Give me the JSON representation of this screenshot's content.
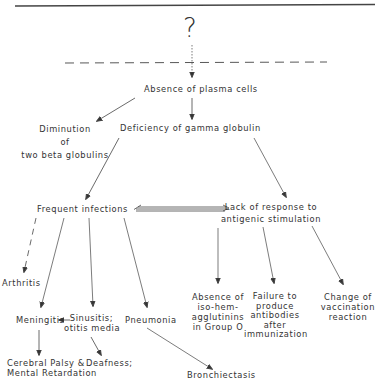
{
  "diagram": {
    "root": "?",
    "nodes": {
      "absence_plasma": "Absence of plasma cells",
      "diminution": [
        "Diminution",
        "of",
        "two beta globulins"
      ],
      "deficiency_gamma": "Deficiency of gamma globulin",
      "frequent_infections": "Frequent infections",
      "lack_response": [
        "Lack of response to",
        "antigenic stimulation"
      ],
      "arthritis": "Arthritis",
      "meningitis": "Meningitis",
      "sinusitis": [
        "Sinusitis;",
        "otitis media"
      ],
      "pneumonia": "Pneumonia",
      "cerebral_palsy": [
        "Cerebral Palsy &",
        "Mental Retardation"
      ],
      "deafness": "Deafness;",
      "bronchiectasis": "Bronchiectasis",
      "absence_isohem": [
        "Absence of",
        "iso-hem-",
        "agglutinins",
        "in Group O"
      ],
      "failure_antibodies": [
        "Failure to",
        "produce",
        "antibodies",
        "after",
        "immunization"
      ],
      "change_vaccination": [
        "Change of",
        "vaccination",
        "reaction"
      ]
    },
    "edges": [
      {
        "from": "root",
        "to": "absence_plasma",
        "style": "dotted"
      },
      {
        "from": "absence_plasma",
        "to": "diminution",
        "style": "solid"
      },
      {
        "from": "absence_plasma",
        "to": "deficiency_gamma",
        "style": "solid"
      },
      {
        "from": "deficiency_gamma",
        "to": "frequent_infections",
        "style": "solid"
      },
      {
        "from": "deficiency_gamma",
        "to": "lack_response",
        "style": "solid"
      },
      {
        "from": "frequent_infections",
        "to": "lack_response",
        "style": "double-bidirectional"
      },
      {
        "from": "frequent_infections",
        "to": "arthritis",
        "style": "dashed"
      },
      {
        "from": "frequent_infections",
        "to": "meningitis",
        "style": "solid"
      },
      {
        "from": "frequent_infections",
        "to": "sinusitis",
        "style": "solid"
      },
      {
        "from": "frequent_infections",
        "to": "pneumonia",
        "style": "solid"
      },
      {
        "from": "sinusitis",
        "to": "meningitis",
        "style": "solid"
      },
      {
        "from": "meningitis",
        "to": "cerebral_palsy",
        "style": "solid"
      },
      {
        "from": "sinusitis",
        "to": "deafness",
        "style": "solid"
      },
      {
        "from": "pneumonia",
        "to": "bronchiectasis",
        "style": "solid"
      },
      {
        "from": "lack_response",
        "to": "absence_isohem",
        "style": "solid"
      },
      {
        "from": "lack_response",
        "to": "failure_antibodies",
        "style": "solid"
      },
      {
        "from": "lack_response",
        "to": "change_vaccination",
        "style": "solid"
      }
    ]
  }
}
